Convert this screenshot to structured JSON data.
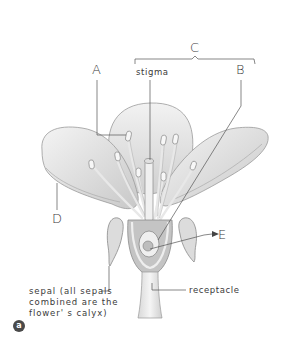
{
  "diagram": {
    "labels": {
      "A": "A",
      "B": "B",
      "C": "C",
      "D": "D",
      "E": "E",
      "stigma": "stigma",
      "receptacle": "receptacle",
      "sepal": "sepal (all sepals\ncombined are the\nflower' s calyx)"
    },
    "panel_badge": "a",
    "colors": {
      "line": "#555555",
      "petal_fill": "#ececec",
      "petal_shade": "#cfcfcf",
      "ovary": "#bdbdbd",
      "badge": "#4a4a4a"
    }
  }
}
